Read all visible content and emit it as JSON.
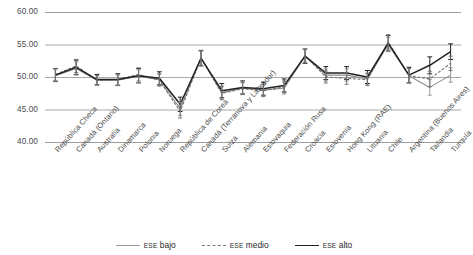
{
  "chart_data": {
    "type": "line",
    "title": "",
    "subtitle": "",
    "xlabel": "",
    "ylabel": "",
    "ylim": [
      40.0,
      60.0
    ],
    "yticks": [
      "40.00",
      "45.00",
      "50.00",
      "55.00",
      "60.00"
    ],
    "ytick_values": [
      40.0,
      45.0,
      50.0,
      55.0,
      60.0
    ],
    "grid": "horizontal",
    "legend_position": "bottom-center",
    "error_bars": true,
    "categories": [
      "República Checa",
      "Canadá (Ontario)",
      "Australia",
      "Dinamarca",
      "Polonia",
      "Noruega",
      "República de Corea",
      "Canadá (Terranova y Labrador)",
      "Suiza",
      "Alemania",
      "Eslovaquia",
      "Federación Rusa",
      "Croacia",
      "Eslovenia",
      "Hong Kong (RAE)",
      "Lituania",
      "Chile",
      "Argentina (Buenos Aires)",
      "Tailandia",
      "Turquía"
    ],
    "series": [
      {
        "name": "ESE bajo",
        "style": "solid-light",
        "color": "#8d8d8d",
        "values": [
          50.2,
          51.3,
          49.5,
          49.5,
          50.1,
          49.6,
          45.1,
          52.9,
          47.6,
          48.3,
          48.0,
          48.3,
          53.2,
          50.3,
          50.3,
          49.7,
          55.0,
          50.2,
          48.4,
          50.3
        ],
        "errors": [
          1.0,
          1.1,
          0.8,
          0.9,
          1.1,
          1.0,
          1.1,
          1.2,
          1.1,
          1.0,
          1.0,
          1.0,
          1.1,
          1.0,
          1.0,
          1.0,
          1.2,
          1.2,
          1.3,
          1.2
        ]
      },
      {
        "name": "ESE medio",
        "style": "dashed",
        "color": "#6e6e6e",
        "values": [
          50.4,
          51.7,
          49.5,
          49.6,
          50.4,
          49.5,
          44.7,
          52.9,
          47.5,
          48.2,
          47.9,
          48.5,
          53.3,
          50.0,
          49.8,
          49.6,
          55.4,
          50.2,
          49.7,
          52.1
        ],
        "errors": [
          1.0,
          1.1,
          0.8,
          0.9,
          1.1,
          1.0,
          1.1,
          1.2,
          1.1,
          1.0,
          1.0,
          1.0,
          1.1,
          1.0,
          1.0,
          1.0,
          1.2,
          1.2,
          1.3,
          1.2
        ]
      },
      {
        "name": "ESE alto",
        "style": "solid-dark",
        "color": "#222222",
        "values": [
          50.3,
          51.5,
          49.6,
          49.6,
          50.2,
          49.8,
          45.8,
          52.9,
          47.9,
          48.4,
          48.2,
          48.7,
          53.2,
          50.6,
          50.6,
          50.0,
          55.2,
          50.3,
          51.8,
          53.9
        ],
        "errors": [
          1.0,
          1.1,
          0.8,
          0.9,
          1.1,
          1.0,
          1.1,
          1.2,
          1.1,
          1.0,
          1.0,
          1.0,
          1.1,
          1.0,
          1.0,
          1.0,
          1.2,
          1.2,
          1.3,
          1.2
        ]
      }
    ]
  },
  "legend": {
    "items": [
      {
        "prefix": "ESE",
        "label": " bajo",
        "color": "#9a9a9a",
        "style": "solid"
      },
      {
        "prefix": "ESE",
        "label": " medio",
        "color": "#7a7a7a",
        "style": "dashed"
      },
      {
        "prefix": "ESE",
        "label": " alto",
        "color": "#1f1f1f",
        "style": "solid"
      }
    ]
  }
}
